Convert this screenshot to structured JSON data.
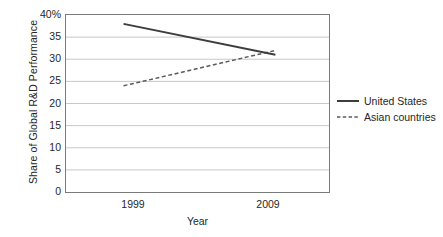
{
  "chart_data": {
    "type": "line",
    "title": "",
    "xlabel": "Year",
    "ylabel": "Share of Global R&D Performance",
    "x": [
      "1999",
      "2009"
    ],
    "xtick_labels": [
      "1999",
      "2009"
    ],
    "ytick_labels": [
      "40%",
      "35",
      "30",
      "25",
      "20",
      "15",
      "10",
      "5",
      "0"
    ],
    "ytick_values": [
      40,
      35,
      30,
      25,
      20,
      15,
      10,
      5,
      0
    ],
    "ylim": [
      0,
      40
    ],
    "grid": "horizontal",
    "legend_position": "right",
    "series": [
      {
        "name": "United States",
        "style": "solid",
        "color": "#3d3d3d",
        "values": [
          38,
          31
        ]
      },
      {
        "name": "Asian countries",
        "style": "dashed",
        "color": "#5a5a5a",
        "values": [
          24,
          32
        ]
      }
    ]
  },
  "legend": {
    "items": [
      {
        "label": "United States",
        "swatch": "solid-line-swatch"
      },
      {
        "label": "Asian countries",
        "swatch": "dashed-line-swatch"
      }
    ]
  },
  "axes": {
    "y_title": "Share of Global R&D Performance",
    "x_title": "Year"
  }
}
